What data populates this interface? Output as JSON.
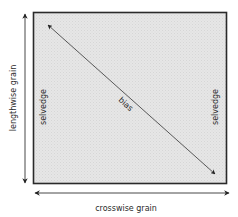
{
  "diagram": {
    "axis_vertical_label": "lengthwise grain",
    "axis_horizontal_label": "crosswise grain",
    "left_edge_label": "selvedge",
    "right_edge_label": "selvedge",
    "diagonal_label": "bias"
  },
  "colors": {
    "fabric_fill": "#e3e3e3",
    "border": "#2a2a2a",
    "arrow": "#222222",
    "text": "#2a2a2a"
  }
}
